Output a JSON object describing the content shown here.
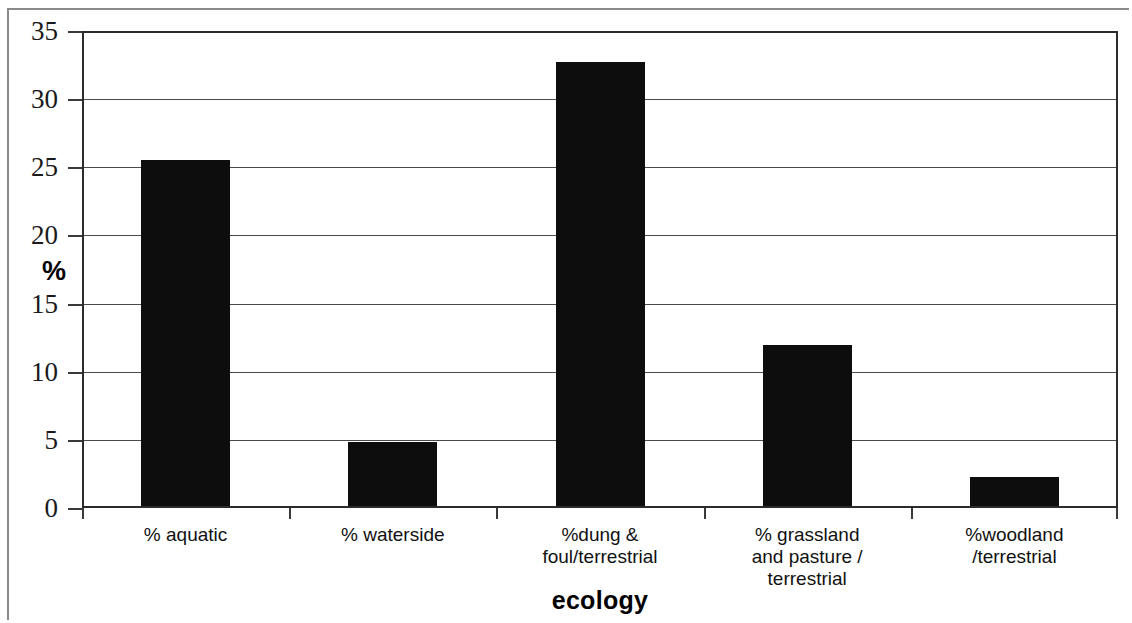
{
  "chart_data": {
    "type": "bar",
    "title": "",
    "xlabel": "ecology",
    "ylabel": "%",
    "categories": [
      "% aquatic",
      "% waterside",
      "%dung &\nfoul/terrestrial",
      "% grassland\nand pasture /\nterrestrial",
      "%woodland\n/terrestrial"
    ],
    "category_lines": [
      [
        "% aquatic"
      ],
      [
        "% waterside"
      ],
      [
        "%dung &",
        "foul/terrestrial"
      ],
      [
        "% grassland",
        "and pasture /",
        "terrestrial"
      ],
      [
        "%woodland",
        "/terrestrial"
      ]
    ],
    "values": [
      25.4,
      4.7,
      32.6,
      11.8,
      2.1
    ],
    "ylim": [
      0,
      35
    ],
    "ytick_step": 5,
    "yticks": [
      35,
      30,
      25,
      20,
      15,
      10,
      5,
      0
    ],
    "ytick_labels": [
      "35",
      "30",
      "25",
      "20",
      "15",
      "10",
      "5",
      "0"
    ],
    "grid": true,
    "legend": false,
    "bar_color": "#0d0d0d",
    "axis_color": "#2b2b2b",
    "gridline_color": "#4a4a4a",
    "background": "#ffffff"
  }
}
